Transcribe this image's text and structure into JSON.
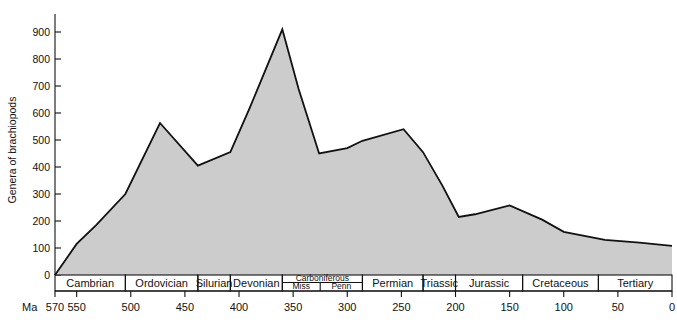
{
  "chart_data": {
    "type": "area",
    "title": "",
    "xlabel": "Ma",
    "ylabel": "Genera of brachiopods",
    "xlim": [
      570,
      0
    ],
    "ylim": [
      0,
      950
    ],
    "grid": false,
    "legend": "none",
    "fill_color": "#cccccc",
    "line_color": "#111111",
    "y_ticks": [
      0,
      100,
      200,
      300,
      400,
      500,
      600,
      700,
      800,
      900
    ],
    "x_ticks": [
      570,
      550,
      500,
      450,
      400,
      350,
      300,
      250,
      200,
      150,
      100,
      50,
      0
    ],
    "x": [
      570,
      550,
      532,
      505,
      473,
      438,
      408,
      390,
      360,
      345,
      326,
      300,
      286,
      248,
      230,
      212,
      197,
      182,
      150,
      120,
      100,
      62,
      30,
      0
    ],
    "values": [
      0,
      115,
      185,
      300,
      563,
      405,
      455,
      620,
      910,
      690,
      450,
      470,
      497,
      540,
      455,
      330,
      215,
      225,
      258,
      205,
      160,
      130,
      120,
      108
    ],
    "annotations": [
      {
        "label": "Cambrian peak",
        "x": 473,
        "y": 563
      },
      {
        "label": "Devonian maximum",
        "x": 360,
        "y": 910
      },
      {
        "label": "Permian peak",
        "x": 248,
        "y": 540
      },
      {
        "label": "End-Permian low",
        "x": 197,
        "y": 215
      },
      {
        "label": "Jurassic rebound",
        "x": 150,
        "y": 258
      }
    ],
    "periods": [
      {
        "name": "Cambrian",
        "start": 570,
        "end": 505,
        "subdivisions": []
      },
      {
        "name": "Ordovician",
        "start": 505,
        "end": 438,
        "subdivisions": []
      },
      {
        "name": "Silurian",
        "start": 438,
        "end": 408,
        "subdivisions": []
      },
      {
        "name": "Devonian",
        "start": 408,
        "end": 360,
        "subdivisions": []
      },
      {
        "name": "Carboniferous",
        "start": 360,
        "end": 286,
        "subdivisions": [
          {
            "name": "Miss",
            "start": 360,
            "end": 325
          },
          {
            "name": "Penn",
            "start": 325,
            "end": 286
          }
        ]
      },
      {
        "name": "Permian",
        "start": 286,
        "end": 230,
        "subdivisions": []
      },
      {
        "name": "Triassic",
        "start": 230,
        "end": 200,
        "subdivisions": []
      },
      {
        "name": "Jurassic",
        "start": 200,
        "end": 138,
        "subdivisions": []
      },
      {
        "name": "Cretaceous",
        "start": 138,
        "end": 68,
        "subdivisions": []
      },
      {
        "name": "Tertiary",
        "start": 68,
        "end": 0,
        "subdivisions": []
      }
    ]
  },
  "axis": {
    "y_label": "Genera of brachiopods",
    "x_unit_label": "Ma",
    "y_tick_labels": [
      "0",
      "100",
      "200",
      "300",
      "400",
      "500",
      "600",
      "700",
      "800",
      "900"
    ],
    "x_tick_labels": [
      "570",
      "550",
      "500",
      "450",
      "400",
      "350",
      "300",
      "250",
      "200",
      "150",
      "100",
      "50",
      "0"
    ]
  },
  "periods_text": {
    "p0": "Cambrian",
    "p1": "Ordovician",
    "p2": "Silurian",
    "p3": "Devonian",
    "p4": "Carboniferous",
    "p4a": "Miss",
    "p4b": "Penn",
    "p5": "Permian",
    "p6": "Triassic",
    "p7": "Jurassic",
    "p8": "Cretaceous",
    "p9": "Tertiary"
  }
}
